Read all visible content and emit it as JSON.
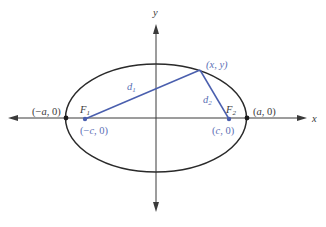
{
  "diagram": {
    "colors": {
      "axis": "#3a3a3a",
      "ellipse": "#2a2a2a",
      "distance_lines": "#4a5fae",
      "label_blue": "#5b6fb5",
      "label_black": "#3a3a3a"
    },
    "axes": {
      "x_label": "x",
      "y_label": "y"
    },
    "points": {
      "left_vertex": {
        "label_pre": "(−",
        "var": "a",
        "label_post": ", 0)"
      },
      "right_vertex": {
        "label_pre": "(",
        "var": "a",
        "label_post": ", 0)"
      },
      "focus1": {
        "name": "F",
        "sub": "1",
        "coord_pre": "(−",
        "var": "c",
        "coord_post": ", 0)"
      },
      "focus2": {
        "name": "F",
        "sub": "2",
        "coord_pre": "(",
        "var": "c",
        "coord_post": ", 0)"
      },
      "point_on_ellipse": {
        "label": "(x, y)"
      }
    },
    "distances": {
      "d1": {
        "name": "d",
        "sub": "1"
      },
      "d2": {
        "name": "d",
        "sub": "2"
      }
    }
  }
}
